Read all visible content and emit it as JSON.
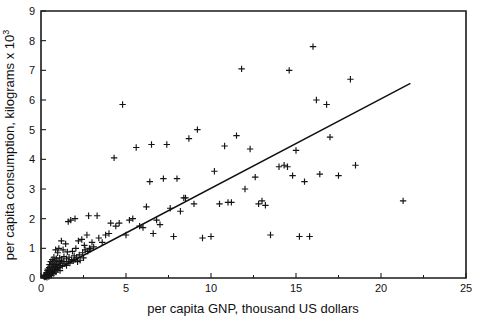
{
  "chart_data": {
    "type": "scatter",
    "title": "",
    "xlabel": "per capita GNP, thousand US dollars",
    "ylabel": "per capita consumption, kilograms x 10",
    "ylabel_superscript": "3",
    "xlim": [
      0,
      25
    ],
    "ylim": [
      0,
      9
    ],
    "xticks": [
      0,
      5,
      10,
      15,
      20,
      25
    ],
    "xtick_labels": [
      "0",
      "5",
      "10",
      "15",
      "20",
      "25"
    ],
    "yticks": [
      0,
      1,
      2,
      3,
      4,
      5,
      6,
      7,
      8,
      9
    ],
    "ytick_labels": [
      "0",
      "1",
      "2",
      "3",
      "4",
      "5",
      "6",
      "7",
      "8",
      "9"
    ],
    "grid": false,
    "legend": false,
    "marker": "plus",
    "marker_color": "#141414",
    "fit_line": {
      "label": "linear regression fit",
      "color": "#111111",
      "x_start": 0.3,
      "y_start": 0.1,
      "x_end": 21.7,
      "y_end": 6.55
    },
    "points": [
      [
        0.18,
        0.05
      ],
      [
        0.2,
        0.08
      ],
      [
        0.22,
        0.03
      ],
      [
        0.25,
        0.1
      ],
      [
        0.27,
        0.05
      ],
      [
        0.3,
        0.12
      ],
      [
        0.3,
        0.05
      ],
      [
        0.32,
        0.18
      ],
      [
        0.33,
        0.08
      ],
      [
        0.35,
        0.02
      ],
      [
        0.36,
        0.15
      ],
      [
        0.38,
        0.25
      ],
      [
        0.4,
        0.07
      ],
      [
        0.4,
        0.3
      ],
      [
        0.42,
        0.12
      ],
      [
        0.45,
        0.2
      ],
      [
        0.46,
        0.05
      ],
      [
        0.48,
        0.35
      ],
      [
        0.5,
        0.15
      ],
      [
        0.5,
        0.45
      ],
      [
        0.52,
        0.08
      ],
      [
        0.55,
        0.25
      ],
      [
        0.57,
        0.55
      ],
      [
        0.6,
        0.18
      ],
      [
        0.6,
        0.4
      ],
      [
        0.62,
        0.1
      ],
      [
        0.65,
        0.3
      ],
      [
        0.66,
        0.62
      ],
      [
        0.68,
        0.2
      ],
      [
        0.7,
        0.5
      ],
      [
        0.72,
        0.35
      ],
      [
        0.75,
        0.15
      ],
      [
        0.76,
        0.7
      ],
      [
        0.78,
        0.45
      ],
      [
        0.8,
        0.25
      ],
      [
        0.82,
        0.58
      ],
      [
        0.85,
        0.38
      ],
      [
        0.86,
        0.95
      ],
      [
        0.88,
        0.2
      ],
      [
        0.9,
        0.65
      ],
      [
        0.92,
        0.45
      ],
      [
        0.95,
        0.3
      ],
      [
        0.98,
        0.85
      ],
      [
        1.0,
        0.55
      ],
      [
        1.0,
        0.35
      ],
      [
        1.05,
        1.0
      ],
      [
        1.08,
        0.42
      ],
      [
        1.1,
        0.68
      ],
      [
        1.12,
        0.25
      ],
      [
        1.15,
        0.5
      ],
      [
        1.2,
        1.25
      ],
      [
        1.2,
        0.6
      ],
      [
        1.25,
        0.4
      ],
      [
        1.3,
        0.95
      ],
      [
        1.3,
        0.55
      ],
      [
        1.35,
        0.72
      ],
      [
        1.4,
        0.48
      ],
      [
        1.45,
        1.15
      ],
      [
        1.5,
        0.65
      ],
      [
        1.5,
        0.42
      ],
      [
        1.55,
        0.88
      ],
      [
        1.6,
        1.9
      ],
      [
        1.6,
        0.55
      ],
      [
        1.65,
        0.7
      ],
      [
        1.7,
        0.5
      ],
      [
        1.75,
        1.95
      ],
      [
        1.8,
        0.62
      ],
      [
        1.85,
        0.9
      ],
      [
        1.9,
        0.58
      ],
      [
        1.95,
        0.75
      ],
      [
        2.0,
        2.0
      ],
      [
        2.0,
        0.62
      ],
      [
        2.05,
        1.0
      ],
      [
        2.1,
        0.7
      ],
      [
        2.15,
        0.55
      ],
      [
        2.2,
        1.25
      ],
      [
        2.25,
        0.78
      ],
      [
        2.3,
        0.6
      ],
      [
        2.4,
        1.3
      ],
      [
        2.45,
        0.85
      ],
      [
        2.5,
        0.68
      ],
      [
        2.55,
        1.1
      ],
      [
        2.6,
        0.95
      ],
      [
        2.7,
        1.45
      ],
      [
        2.75,
        0.9
      ],
      [
        2.8,
        2.1
      ],
      [
        2.85,
        1.0
      ],
      [
        2.9,
        0.98
      ],
      [
        3.0,
        1.2
      ],
      [
        3.1,
        1.05
      ],
      [
        3.3,
        2.1
      ],
      [
        3.4,
        1.35
      ],
      [
        3.6,
        1.2
      ],
      [
        3.8,
        1.45
      ],
      [
        4.0,
        1.5
      ],
      [
        4.1,
        1.85
      ],
      [
        4.3,
        4.05
      ],
      [
        4.4,
        1.75
      ],
      [
        4.6,
        1.85
      ],
      [
        4.8,
        5.85
      ],
      [
        5.0,
        1.45
      ],
      [
        5.2,
        1.95
      ],
      [
        5.4,
        2.0
      ],
      [
        5.6,
        4.4
      ],
      [
        5.8,
        1.75
      ],
      [
        6.0,
        1.7
      ],
      [
        6.2,
        2.4
      ],
      [
        6.4,
        3.25
      ],
      [
        6.5,
        4.5
      ],
      [
        6.6,
        1.5
      ],
      [
        6.8,
        1.95
      ],
      [
        7.0,
        1.8
      ],
      [
        7.2,
        3.35
      ],
      [
        7.4,
        4.5
      ],
      [
        7.6,
        2.35
      ],
      [
        7.8,
        1.4
      ],
      [
        8.0,
        3.35
      ],
      [
        8.2,
        2.25
      ],
      [
        8.4,
        2.7
      ],
      [
        8.5,
        2.7
      ],
      [
        8.7,
        4.7
      ],
      [
        9.0,
        2.5
      ],
      [
        9.2,
        5.0
      ],
      [
        9.5,
        1.35
      ],
      [
        10.0,
        1.4
      ],
      [
        10.2,
        3.6
      ],
      [
        10.5,
        2.5
      ],
      [
        10.8,
        4.45
      ],
      [
        11.0,
        2.55
      ],
      [
        11.2,
        2.55
      ],
      [
        11.5,
        4.8
      ],
      [
        11.8,
        7.05
      ],
      [
        12.0,
        3.0
      ],
      [
        12.3,
        4.35
      ],
      [
        12.6,
        3.4
      ],
      [
        12.8,
        2.5
      ],
      [
        13.0,
        2.6
      ],
      [
        13.2,
        2.45
      ],
      [
        13.5,
        1.45
      ],
      [
        14.0,
        3.75
      ],
      [
        14.3,
        3.8
      ],
      [
        14.5,
        3.75
      ],
      [
        14.6,
        7.0
      ],
      [
        14.8,
        3.45
      ],
      [
        15.0,
        4.3
      ],
      [
        15.2,
        1.4
      ],
      [
        15.5,
        3.25
      ],
      [
        15.8,
        1.4
      ],
      [
        16.0,
        7.8
      ],
      [
        16.2,
        6.0
      ],
      [
        16.4,
        3.5
      ],
      [
        16.8,
        5.85
      ],
      [
        17.0,
        4.75
      ],
      [
        17.5,
        3.45
      ],
      [
        18.2,
        6.7
      ],
      [
        18.5,
        3.8
      ],
      [
        21.3,
        2.6
      ]
    ]
  }
}
